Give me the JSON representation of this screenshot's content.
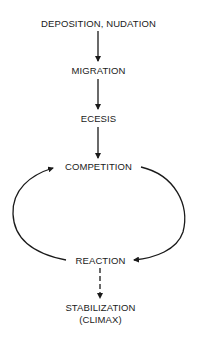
{
  "diagram": {
    "type": "succession-flow",
    "nodes": [
      {
        "id": "deposition",
        "label": "DEPOSITION, NUDATION"
      },
      {
        "id": "migration",
        "label": "MIGRATION"
      },
      {
        "id": "ecesis",
        "label": "ECESIS"
      },
      {
        "id": "competition",
        "label": "COMPETITION"
      },
      {
        "id": "reaction",
        "label": "REACTION"
      },
      {
        "id": "stabilization",
        "label": "STABILIZATION",
        "sublabel": "(CLIMAX)"
      }
    ],
    "edges": [
      {
        "from": "deposition",
        "to": "migration",
        "style": "solid"
      },
      {
        "from": "migration",
        "to": "ecesis",
        "style": "solid"
      },
      {
        "from": "ecesis",
        "to": "competition",
        "style": "solid"
      },
      {
        "from": "competition",
        "to": "reaction",
        "style": "solid-curved",
        "side": "right"
      },
      {
        "from": "reaction",
        "to": "competition",
        "style": "solid-curved",
        "side": "left"
      },
      {
        "from": "reaction",
        "to": "stabilization",
        "style": "dashed"
      }
    ],
    "colors": {
      "ink": "#1a1a1a",
      "background": "#ffffff"
    }
  }
}
